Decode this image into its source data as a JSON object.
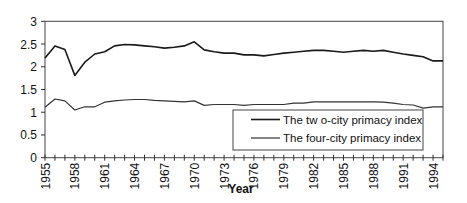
{
  "chart_data": {
    "type": "line",
    "title": "",
    "xlabel": "Year",
    "ylabel": "",
    "ylim": [
      0,
      3
    ],
    "yticks": [
      0,
      0.5,
      1,
      1.5,
      2,
      2.5,
      3
    ],
    "ytick_labels": [
      "0",
      "0.5",
      "1",
      "1.5",
      "2",
      "2.5",
      "3"
    ],
    "xtick_labels": [
      "1955",
      "1958",
      "1961",
      "1964",
      "1967",
      "1970",
      "1973",
      "1976",
      "1979",
      "1982",
      "1985",
      "1988",
      "1991",
      "1994"
    ],
    "grid": false,
    "legend_position": "lower right inside plot",
    "x": [
      1955,
      1956,
      1957,
      1958,
      1959,
      1960,
      1961,
      1962,
      1963,
      1964,
      1965,
      1966,
      1967,
      1968,
      1969,
      1970,
      1971,
      1972,
      1973,
      1974,
      1975,
      1976,
      1977,
      1978,
      1979,
      1980,
      1981,
      1982,
      1983,
      1984,
      1985,
      1986,
      1987,
      1988,
      1989,
      1990,
      1991,
      1992,
      1993,
      1994,
      1995
    ],
    "series": [
      {
        "name": "The tw o-city primacy index",
        "color": "#1a1a1a",
        "values": [
          2.19,
          2.46,
          2.38,
          1.81,
          2.1,
          2.28,
          2.33,
          2.46,
          2.49,
          2.48,
          2.46,
          2.44,
          2.41,
          2.43,
          2.46,
          2.55,
          2.37,
          2.33,
          2.3,
          2.3,
          2.26,
          2.26,
          2.24,
          2.27,
          2.3,
          2.32,
          2.34,
          2.36,
          2.36,
          2.34,
          2.32,
          2.34,
          2.36,
          2.34,
          2.36,
          2.32,
          2.28,
          2.25,
          2.22,
          2.13,
          2.13
        ]
      },
      {
        "name": "The four-city primacy index",
        "color": "#333333",
        "values": [
          1.11,
          1.29,
          1.25,
          1.05,
          1.12,
          1.12,
          1.22,
          1.25,
          1.27,
          1.28,
          1.28,
          1.26,
          1.25,
          1.24,
          1.23,
          1.25,
          1.15,
          1.17,
          1.17,
          1.17,
          1.15,
          1.17,
          1.17,
          1.17,
          1.17,
          1.2,
          1.2,
          1.23,
          1.23,
          1.23,
          1.23,
          1.23,
          1.23,
          1.23,
          1.22,
          1.2,
          1.17,
          1.16,
          1.09,
          1.12,
          1.12
        ]
      }
    ]
  },
  "legend": {
    "items": [
      {
        "label": "The tw o-city primacy index"
      },
      {
        "label": "The four-city primacy index"
      }
    ]
  },
  "axes": {
    "xlabel": "Year"
  }
}
